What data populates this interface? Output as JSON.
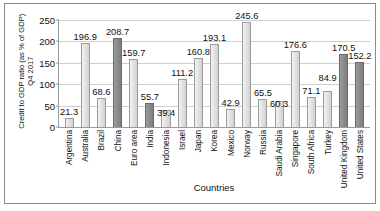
{
  "chart_data": {
    "type": "bar",
    "title": "",
    "xlabel": "Countries",
    "ylabel": "Credit to GDP ratio (as % of GDP)\nQ4 2017",
    "ylim": [
      0,
      250
    ],
    "yticks": [
      0,
      50,
      100,
      150,
      200,
      250
    ],
    "grid": true,
    "legend": "none",
    "categories": [
      "Argentina",
      "Australia",
      "Brazil",
      "China",
      "Euro area",
      "India",
      "Indonesia",
      "Israel",
      "Japan",
      "Korea",
      "Mexico",
      "Norway",
      "Russia",
      "Saudi Arabia",
      "Singapore",
      "South Africa",
      "Turkey",
      "United Kingdom",
      "United States"
    ],
    "values": [
      21.3,
      196.9,
      68.6,
      208.7,
      159.7,
      55.7,
      39.4,
      111.2,
      160.8,
      193.1,
      42.9,
      245.6,
      65.5,
      60.3,
      176.6,
      71.1,
      84.9,
      170.5,
      152.2
    ],
    "value_labels": [
      "21.3",
      "196.9",
      "68.6",
      "208.7",
      "159.7",
      "55.7",
      "39.4",
      "111.2",
      "160.8",
      "193.1",
      "42.9",
      "245.6",
      "65.5",
      "60.3",
      "176.6",
      "71.1",
      "84.9",
      "170.5",
      "152.2"
    ],
    "highlighted": [
      false,
      false,
      false,
      true,
      false,
      true,
      false,
      false,
      false,
      false,
      false,
      false,
      false,
      false,
      false,
      false,
      false,
      true,
      true
    ],
    "colors": {
      "bar_light": "#e3e3e3",
      "bar_dark": "#8d8d8d",
      "bar_border": "#9b9b9b",
      "grid": "#cfcfcf",
      "axis": "#9a9a9a",
      "text": "#111111",
      "background": "#ffffff"
    }
  }
}
